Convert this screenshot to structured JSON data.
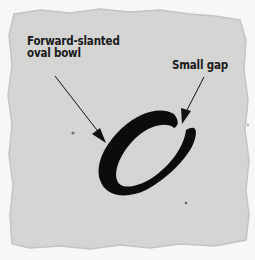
{
  "diagram": {
    "annotations": [
      {
        "id": "bowl",
        "line1": "Forward-slanted",
        "line2": "oval bowl"
      },
      {
        "id": "gap",
        "line1": "Small gap"
      }
    ],
    "colors": {
      "paper": "#d6d6d4",
      "paper_edge": "#f4f4f4",
      "ink": "#0c0c0c",
      "text": "#1a1a1a"
    }
  }
}
